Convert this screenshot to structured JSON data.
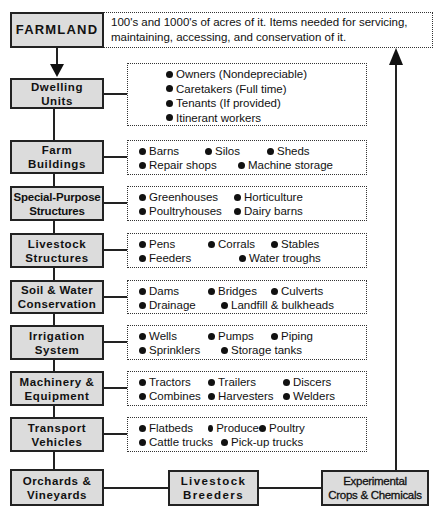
{
  "title_box": {
    "label": "FARMLAND",
    "description_line1": "100's and 1000's of acres of it. Items needed for servicing,",
    "description_line2": "maintaining, accessing, and conservation of it."
  },
  "categories": [
    {
      "id": "dwelling-units",
      "label_line1": "Dwelling",
      "label_line2": "Units",
      "items_rows": [
        [
          "Owners  (Nondepreciable)"
        ],
        [
          "Caretakers  (Full time)"
        ],
        [
          "Tenants  (If provided)"
        ],
        [
          "Itinerant workers"
        ]
      ]
    },
    {
      "id": "farm-buildings",
      "label_line1": "Farm",
      "label_line2": "Buildings",
      "items_rows": [
        [
          "Barns",
          "Silos",
          "Sheds"
        ],
        [
          "Repair shops",
          "Machine storage"
        ]
      ]
    },
    {
      "id": "special-purpose-structures",
      "label_line1": "Special-Purpose",
      "label_line2": "Structures",
      "items_rows": [
        [
          "Greenhouses",
          "Horticulture"
        ],
        [
          "Poultryhouses",
          "Dairy barns"
        ]
      ]
    },
    {
      "id": "livestock-structures",
      "label_line1": "Livestock",
      "label_line2": "Structures",
      "items_rows": [
        [
          "Pens",
          "Corrals",
          "Stables"
        ],
        [
          "Feeders",
          "Water troughs"
        ]
      ]
    },
    {
      "id": "soil-water-conservation",
      "label_line1": "Soil & Water",
      "label_line2": "Conservation",
      "items_rows": [
        [
          "Dams",
          "Bridges",
          "Culverts"
        ],
        [
          "Drainage",
          "Landfill & bulkheads"
        ]
      ]
    },
    {
      "id": "irrigation-system",
      "label_line1": "Irrigation",
      "label_line2": "System",
      "items_rows": [
        [
          "Wells",
          "Pumps",
          "Piping"
        ],
        [
          "Sprinklers",
          "Storage tanks"
        ]
      ]
    },
    {
      "id": "machinery-equipment",
      "label_line1": "Machinery &",
      "label_line2": "Equipment",
      "items_rows": [
        [
          "Tractors",
          "Trailers",
          "Discers"
        ],
        [
          "Combines",
          "Harvesters",
          "Welders"
        ]
      ]
    },
    {
      "id": "transport-vehicles",
      "label_line1": "Transport",
      "label_line2": "Vehicles",
      "items_rows": [
        [
          "Flatbeds",
          "Produce",
          "Poultry"
        ],
        [
          "Cattle trucks",
          "Pick-up trucks"
        ]
      ]
    }
  ],
  "bottom_row": [
    {
      "id": "orchards-vineyards",
      "label_line1": "Orchards &",
      "label_line2": "Vineyards"
    },
    {
      "id": "livestock-breeders",
      "label_line1": "Livestock",
      "label_line2": "Breeders"
    },
    {
      "id": "experimental-crops-chemicals",
      "label_line1": "Experimental",
      "label_line2": "Crops & Chemicals"
    }
  ]
}
